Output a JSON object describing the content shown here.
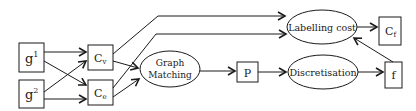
{
  "nodes": {
    "g1": {
      "base": "g",
      "sup": "1"
    },
    "g2": {
      "base": "g",
      "sup": "2"
    },
    "cv": {
      "base": "C",
      "sub": "v"
    },
    "ce": {
      "base": "C",
      "sub": "e"
    },
    "graph_matching": {
      "line1": "Graph",
      "line2": "Matching"
    },
    "p": {
      "label": "P"
    },
    "discretisation": {
      "label": "Discretisation"
    },
    "labelling_cost": {
      "label": "Labelling cost"
    },
    "cf": {
      "base": "C",
      "sub": "f"
    },
    "f": {
      "label": "f"
    }
  },
  "edges": [
    {
      "from": "g1",
      "to": "cv"
    },
    {
      "from": "g1",
      "to": "ce"
    },
    {
      "from": "g2",
      "to": "cv"
    },
    {
      "from": "g2",
      "to": "ce"
    },
    {
      "from": "cv",
      "to": "graph_matching"
    },
    {
      "from": "ce",
      "to": "graph_matching"
    },
    {
      "from": "cv",
      "to": "labelling_cost"
    },
    {
      "from": "ce",
      "to": "labelling_cost"
    },
    {
      "from": "graph_matching",
      "to": "p"
    },
    {
      "from": "p",
      "to": "discretisation"
    },
    {
      "from": "discretisation",
      "to": "f"
    },
    {
      "from": "f",
      "to": "labelling_cost"
    },
    {
      "from": "labelling_cost",
      "to": "cf"
    }
  ],
  "colors": {
    "stroke": "#1a1a1a",
    "background": "#ffffff"
  }
}
